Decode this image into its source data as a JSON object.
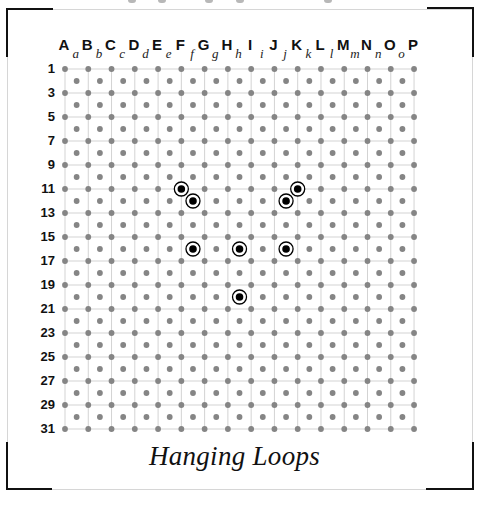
{
  "title": "Hanging Loops",
  "colors": {
    "grid_line": "#d3d3d3",
    "dot": "#858585",
    "marker": "#000000",
    "frame_line": "#d6d6d6",
    "bracket": "#111111"
  },
  "columns": {
    "upper": [
      "A",
      "B",
      "C",
      "D",
      "E",
      "F",
      "G",
      "H",
      "I",
      "J",
      "K",
      "L",
      "M",
      "N",
      "O",
      "P"
    ],
    "lower": [
      "a",
      "b",
      "c",
      "d",
      "e",
      "f",
      "g",
      "h",
      "i",
      "j",
      "k",
      "l",
      "m",
      "n",
      "o"
    ]
  },
  "row_labels": [
    "1",
    "3",
    "5",
    "7",
    "9",
    "11",
    "13",
    "15",
    "17",
    "19",
    "21",
    "23",
    "25",
    "27",
    "29",
    "31"
  ],
  "rows_total": 31,
  "chart_data": {
    "type": "scatter",
    "title": "Hanging Loops",
    "grid": {
      "odd_rows_columns": "A-P (uppercase)",
      "even_rows_columns": "a-o (lowercase)",
      "rows": [
        1,
        31
      ]
    },
    "markers": [
      {
        "col": "F",
        "row": 11
      },
      {
        "col": "f",
        "row": 12
      },
      {
        "col": "K",
        "row": 11
      },
      {
        "col": "j",
        "row": 12
      },
      {
        "col": "f",
        "row": 16
      },
      {
        "col": "h",
        "row": 16
      },
      {
        "col": "j",
        "row": 16
      },
      {
        "col": "h",
        "row": 20
      }
    ]
  }
}
